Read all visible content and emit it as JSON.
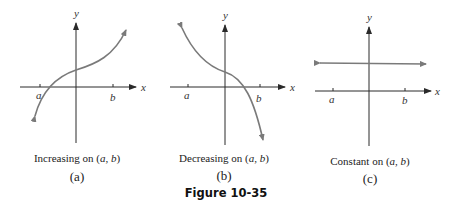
{
  "figure": {
    "title": "Figure 10-35",
    "panels": [
      {
        "id": "a",
        "sublabel": "(a)",
        "caption_prefix": "Increasing on (",
        "caption_a": "a",
        "caption_sep": ", ",
        "caption_b": "b",
        "caption_suffix": ")",
        "behavior": "increasing",
        "axis_x_label": "x",
        "axis_y_label": "y",
        "tick_left_label": "a",
        "tick_right_label": "b"
      },
      {
        "id": "b",
        "sublabel": "(b)",
        "caption_prefix": "Decreasing on (",
        "caption_a": "a",
        "caption_sep": ", ",
        "caption_b": "b",
        "caption_suffix": ")",
        "behavior": "decreasing",
        "axis_x_label": "x",
        "axis_y_label": "y",
        "tick_left_label": "a",
        "tick_right_label": "b"
      },
      {
        "id": "c",
        "sublabel": "(c)",
        "caption_prefix": "Constant on (",
        "caption_a": "a",
        "caption_sep": ", ",
        "caption_b": "b",
        "caption_suffix": ")",
        "behavior": "constant",
        "axis_x_label": "x",
        "axis_y_label": "y",
        "tick_left_label": "a",
        "tick_right_label": "b"
      }
    ]
  },
  "colors": {
    "axis": "#2a2a2a",
    "curve": "#7a7a7a"
  }
}
